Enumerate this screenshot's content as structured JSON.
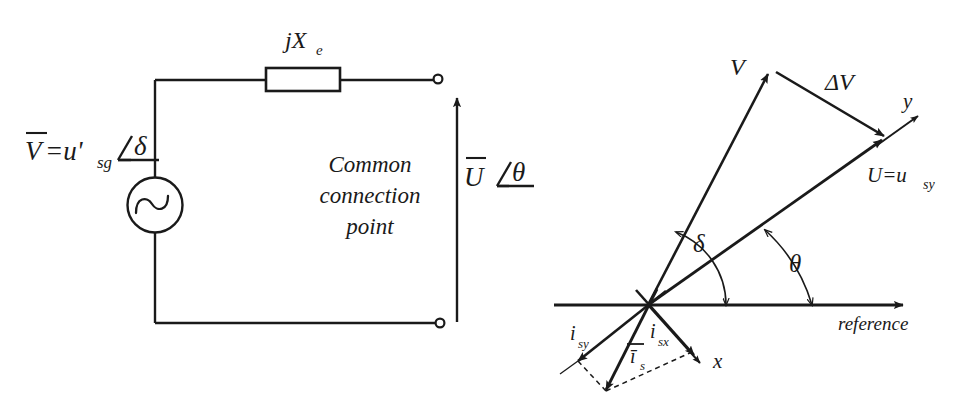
{
  "figure": {
    "background_color": "#ffffff",
    "line_color": "#1a1a1a",
    "width": 959,
    "height": 410
  },
  "circuit": {
    "name": "thevenin-equivalent-circuit",
    "source_label": {
      "bar_symbol": "V",
      "equals": "=u'",
      "sub": "sg",
      "angle_symbol": "∠",
      "angle_value": "δ",
      "full_text": "V̄=u'sg ∠δ"
    },
    "reactance_label": {
      "text": "jX",
      "sub": "e",
      "full_text": "jXe"
    },
    "node_label": {
      "line1": "Common",
      "line2": "connection",
      "line3": "point"
    },
    "output_label": {
      "bar_symbol": "U",
      "angle_symbol": "∠",
      "angle_value": "θ",
      "full_text": "Ū ∠θ"
    },
    "components": [
      {
        "name": "ac-voltage-source",
        "type": "sinusoidal-source"
      },
      {
        "name": "series-reactance",
        "type": "impedance-box"
      },
      {
        "name": "output-terminal-top",
        "type": "terminal"
      },
      {
        "name": "output-terminal-bottom",
        "type": "terminal"
      },
      {
        "name": "output-voltage-arrow",
        "type": "arrow"
      }
    ]
  },
  "phasor": {
    "name": "phasor-diagram",
    "vectors": [
      {
        "name": "vector-V",
        "label": "V"
      },
      {
        "name": "vector-delta-V",
        "label": "ΔV"
      },
      {
        "name": "vector-U",
        "label": "U=u",
        "sub": "sy",
        "full_text": "U=usy"
      },
      {
        "name": "axis-y",
        "label": "y"
      },
      {
        "name": "axis-x",
        "label": "x"
      },
      {
        "name": "current-is",
        "label": "ī",
        "sub": "s",
        "full_text": "īs"
      },
      {
        "name": "current-isx",
        "label": "i",
        "sub": "sx",
        "full_text": "isx"
      },
      {
        "name": "current-isy",
        "label": "i",
        "sub": "sy",
        "full_text": "isy"
      }
    ],
    "angles": [
      {
        "name": "angle-delta",
        "label": "δ",
        "between": "reference-to-V"
      },
      {
        "name": "angle-theta",
        "label": "θ",
        "between": "reference-to-U"
      }
    ],
    "reference_axis": {
      "name": "reference-axis",
      "label": "reference"
    }
  }
}
